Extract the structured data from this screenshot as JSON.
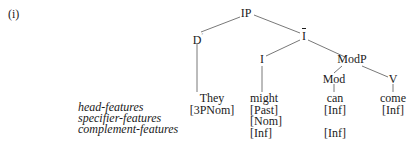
{
  "example_label": "(i)",
  "tree": {
    "nodes": {
      "ip": "IP",
      "d": "D",
      "i_bar": "I",
      "i": "I",
      "modp": "ModP",
      "mod": "Mod",
      "v": "V"
    },
    "leaves": [
      {
        "word": "They",
        "features": [
          "[3PNom]"
        ]
      },
      {
        "word": "might",
        "features": [
          "[Past]",
          "[Nom]",
          "[Inf]"
        ]
      },
      {
        "word": "can",
        "features": [
          "[Inf]",
          "",
          "[Inf]"
        ]
      },
      {
        "word": "come",
        "features": [
          "[Inf]"
        ]
      }
    ]
  },
  "feature_labels": {
    "head": "head-features",
    "specifier": "specifier-features",
    "complement": "complement-features"
  }
}
